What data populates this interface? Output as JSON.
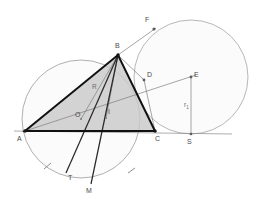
{
  "figure": {
    "width": 260,
    "height": 210,
    "background": "#ffffff"
  },
  "colors": {
    "triangle_fill": "#c9c9c9",
    "triangle_stroke": "#111111",
    "circle_stroke": "#8e8e8e",
    "thin_line": "#767676",
    "label_text": "#4a4a4a",
    "measure_text": "#6a6a6a"
  },
  "points": [
    {
      "id": "A",
      "label": "A",
      "x": 25,
      "y": 131,
      "label_x": 17,
      "label_y": 141,
      "kind": "vertex"
    },
    {
      "id": "B",
      "label": "B",
      "x": 118,
      "y": 55,
      "label_x": 115,
      "label_y": 48,
      "kind": "vertex"
    },
    {
      "id": "C",
      "label": "C",
      "x": 155,
      "y": 131,
      "label_x": 155,
      "label_y": 141,
      "kind": "vertex"
    },
    {
      "id": "O",
      "label": "O",
      "x": 81,
      "y": 119,
      "label_x": 76,
      "label_y": 117,
      "kind": "center"
    },
    {
      "id": "I",
      "label": "I",
      "x": 106,
      "y": 118,
      "label_x": 108,
      "label_y": 114,
      "kind": "center"
    },
    {
      "id": "M",
      "label": "M",
      "x": 91,
      "y": 183,
      "label_x": 87,
      "label_y": 192,
      "kind": "arc-point"
    },
    {
      "id": "T",
      "label": "T",
      "x": 66,
      "y": 172,
      "label_x": 69,
      "label_y": 179,
      "kind": "arc-point"
    },
    {
      "id": "D",
      "label": "D",
      "x": 144,
      "y": 80,
      "label_x": 147,
      "label_y": 77,
      "kind": "tangency"
    },
    {
      "id": "E",
      "label": "E",
      "x": 191,
      "y": 77,
      "label_x": 193,
      "label_y": 76,
      "kind": "center"
    },
    {
      "id": "S",
      "label": "S",
      "x": 191,
      "y": 134,
      "label_x": 188,
      "label_y": 143,
      "kind": "tangency"
    },
    {
      "id": "F",
      "label": "F",
      "x": 153,
      "y": 30,
      "label_x": 146,
      "label_y": 22,
      "kind": "tangency"
    }
  ],
  "measures": [
    {
      "id": "R",
      "base": "R",
      "sub": "",
      "x": 93,
      "y": 89,
      "note": "circumradius label near B-O segment"
    },
    {
      "id": "r1",
      "base": "r",
      "sub": "1",
      "x": 185,
      "y": 106,
      "note": "radius of tangent circle, E to S"
    }
  ],
  "circles": [
    {
      "id": "circumcircle",
      "name": "circumcircle-of-ABC",
      "cx": 81,
      "cy": 119,
      "r": 59,
      "fill": "#fbfbfb",
      "stroke": "#8e8e8e"
    },
    {
      "id": "tangent-circle",
      "name": "tangent-circle-at-E",
      "cx": 191,
      "cy": 77,
      "r": 57,
      "fill": "#fbfbfb",
      "stroke": "#9a9a9a"
    }
  ],
  "triangle": {
    "name": "triangle-ABC",
    "vertices": [
      "A",
      "B",
      "C"
    ],
    "path": "M 25 131 L 118 55 L 155 131 Z"
  },
  "segments": [
    {
      "id": "BM",
      "name": "angle-bisector-B-to-M",
      "x1": 118,
      "y1": 55,
      "x2": 91,
      "y2": 183,
      "weight": "med"
    },
    {
      "id": "AT",
      "name": "segment-A-to-T",
      "x1": 118,
      "y1": 55,
      "x2": 66,
      "y2": 172,
      "weight": "med"
    },
    {
      "id": "AE",
      "name": "line-A-through-I-to-E",
      "x1": 25,
      "y1": 131,
      "x2": 191,
      "y2": 77,
      "weight": "thin"
    },
    {
      "id": "BD",
      "name": "segment-B-to-D",
      "x1": 118,
      "y1": 55,
      "x2": 144,
      "y2": 80,
      "weight": "thin"
    },
    {
      "id": "BF",
      "name": "segment-B-to-F",
      "x1": 118,
      "y1": 55,
      "x2": 153,
      "y2": 30,
      "weight": "thin"
    },
    {
      "id": "BI",
      "name": "segment-B-to-I",
      "x1": 118,
      "y1": 55,
      "x2": 106,
      "y2": 118,
      "weight": "thin"
    },
    {
      "id": "BO",
      "name": "segment-B-to-O",
      "x1": 118,
      "y1": 55,
      "x2": 81,
      "y2": 119,
      "weight": "thin"
    },
    {
      "id": "DC",
      "name": "segment-D-to-C",
      "x1": 144,
      "y1": 80,
      "x2": 155,
      "y2": 131,
      "weight": "thin"
    },
    {
      "id": "ES",
      "name": "radius-E-to-S",
      "x1": 191,
      "y1": 77,
      "x2": 191,
      "y2": 134,
      "weight": "thin"
    },
    {
      "id": "base",
      "name": "base-line-extended",
      "x1": 14,
      "y1": 131,
      "x2": 232,
      "y2": 134,
      "weight": "base"
    }
  ],
  "arc_ticks": [
    {
      "id": "tick-left",
      "name": "arc-tick-left",
      "x1": 44,
      "y1": 168,
      "x2": 50,
      "y2": 163
    },
    {
      "id": "tick-right",
      "name": "arc-tick-right",
      "x1": 128,
      "y1": 172,
      "x2": 134,
      "y2": 168
    }
  ]
}
